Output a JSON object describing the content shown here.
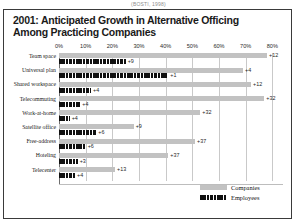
{
  "source_note": "(BOSTI, 1998)",
  "title": "2001: Anticipated Growth in Alternative Officing Among Practicing Companies",
  "legend": {
    "companies_label": "Companies",
    "employees_label": "Employees"
  },
  "colors": {
    "companies": "#c2c2c2",
    "employees": "#101010",
    "frame": "#3a3a3a",
    "grid": "#c9c9c9"
  },
  "chart_data": {
    "type": "bar",
    "orientation": "horizontal",
    "title": "2001: Anticipated Growth in Alternative Officing Among Practicing Companies",
    "xlabel": "",
    "ylabel": "",
    "xlim": [
      0,
      84
    ],
    "grid": true,
    "legend_position": "bottom-right",
    "tick_labels": [
      "0%",
      "10%",
      "20%",
      "30%",
      "40%",
      "50%",
      "60%",
      "70%",
      "80%"
    ],
    "tick_values": [
      0,
      10,
      20,
      30,
      40,
      50,
      60,
      70,
      80
    ],
    "categories": [
      "Team space",
      "Universal plan",
      "Shared workspace",
      "Telecommuting",
      "Work-at-home",
      "Satellite office",
      "Free-address",
      "Hoteling",
      "Telecenter"
    ],
    "series": [
      {
        "name": "Companies",
        "values": [
          78,
          69,
          72,
          77,
          53,
          28,
          51,
          41,
          21
        ],
        "labels": [
          "+12",
          "+4",
          "+12",
          "+32",
          "+32",
          "+9",
          "+37",
          "+37",
          "+13"
        ]
      },
      {
        "name": "Employees",
        "values": [
          25,
          41,
          12,
          8,
          4,
          14,
          10,
          7,
          6
        ],
        "labels": [
          "+9",
          "+1",
          "+4",
          "+4",
          "+4",
          "+6",
          "+6",
          "+3",
          "+4"
        ]
      }
    ]
  }
}
